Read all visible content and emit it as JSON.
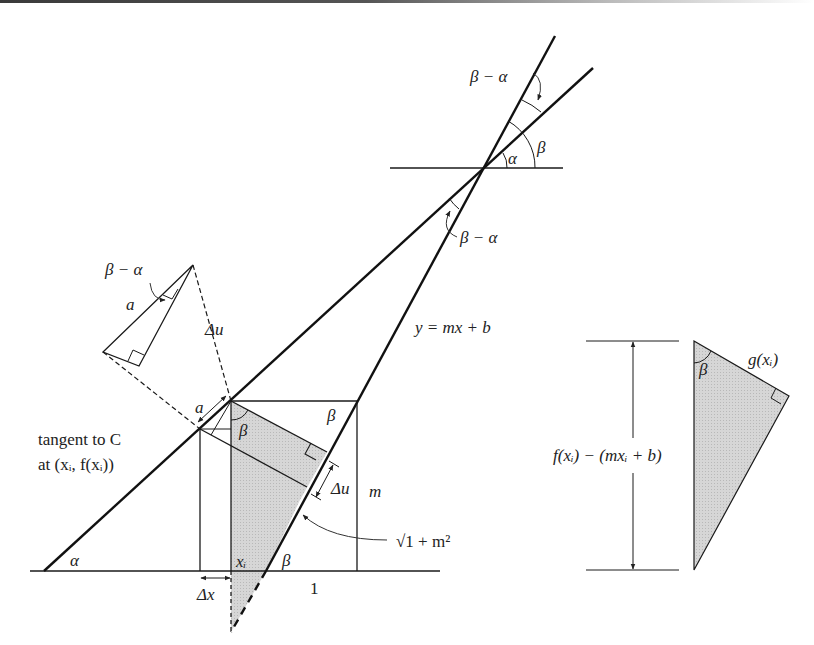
{
  "figure": {
    "colors": {
      "ink": "#1a1a1a",
      "shade": "#d0d0d0",
      "thin": "#333333"
    },
    "labels": {
      "beta_minus_alpha_top": "β − α",
      "alpha_top": "α",
      "beta_top": "β",
      "beta_minus_alpha_mid": "β − α",
      "beta_minus_alpha_small": "β − α",
      "a_small": "a",
      "delta_u_small": "Δu",
      "line_eq": "y = mx + b",
      "a_main": "a",
      "beta_box_top": "β",
      "beta_shaded": "β",
      "delta_u_main": "Δu",
      "m_label": "m",
      "sqrt_label": "√1 + m²",
      "tangent_line1": "tangent to C",
      "tangent_line2": "at (xᵢ, f(xᵢ))",
      "alpha_bottom": "α",
      "xi_label": "xᵢ",
      "beta_bottom": "β",
      "delta_x": "Δx",
      "one_label": "1",
      "right_beta": "β",
      "g_label": "g(xᵢ)",
      "vertical_dim": "f(xᵢ) − (mxᵢ + b)"
    }
  }
}
